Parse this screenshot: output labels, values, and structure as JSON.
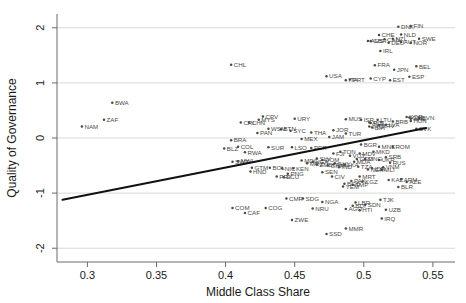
{
  "chart_data": {
    "type": "scatter",
    "title": "",
    "xlabel": "Middle Class Share",
    "ylabel": "Quality of Governance",
    "xlim": [
      0.278,
      0.566
    ],
    "ylim": [
      -2.25,
      2.25
    ],
    "xticks": [
      0.3,
      0.35,
      0.4,
      0.45,
      0.5,
      0.55
    ],
    "xticklabels": [
      "0.3",
      "0.35",
      "0.4",
      "0.45",
      "0.5",
      "0.55"
    ],
    "yticks": [
      -2,
      -1,
      0,
      1,
      2
    ],
    "yticklabels": [
      "-2",
      "-1",
      "0",
      "1",
      "2"
    ],
    "grid": "horizontal-gridlines-at-yticks",
    "legend": "none",
    "marker": "small filled circle with country ISO3 label to the right",
    "fit_line": {
      "label": "linear fit",
      "x_start": 0.282,
      "y_start": -1.12,
      "x_end": 0.545,
      "y_end": 0.18
    },
    "points": [
      {
        "label": "BWA",
        "x": 0.318,
        "y": 0.64
      },
      {
        "label": "ZAF",
        "x": 0.312,
        "y": 0.33
      },
      {
        "label": "NAM",
        "x": 0.296,
        "y": 0.21
      },
      {
        "label": "CHL",
        "x": 0.404,
        "y": 1.33
      },
      {
        "label": "CPV",
        "x": 0.427,
        "y": 0.39
      },
      {
        "label": "PAN",
        "x": 0.423,
        "y": 0.09
      },
      {
        "label": "SYC",
        "x": 0.447,
        "y": 0.13
      },
      {
        "label": "BRA",
        "x": 0.404,
        "y": -0.04
      },
      {
        "label": "COL",
        "x": 0.409,
        "y": -0.16
      },
      {
        "label": "BLZ",
        "x": 0.399,
        "y": -0.19
      },
      {
        "label": "SUR",
        "x": 0.431,
        "y": -0.17
      },
      {
        "label": "LSO",
        "x": 0.448,
        "y": -0.17
      },
      {
        "label": "PER",
        "x": 0.462,
        "y": -0.18
      },
      {
        "label": "MEX",
        "x": 0.455,
        "y": -0.02
      },
      {
        "label": "JAM",
        "x": 0.475,
        "y": 0.02
      },
      {
        "label": "RWA",
        "x": 0.414,
        "y": -0.26
      },
      {
        "label": "MWI",
        "x": 0.409,
        "y": -0.42
      },
      {
        "label": "SWZ",
        "x": 0.405,
        "y": -0.43
      },
      {
        "label": "GTM",
        "x": 0.419,
        "y": -0.54
      },
      {
        "label": "BOL",
        "x": 0.432,
        "y": -0.54
      },
      {
        "label": "NIC",
        "x": 0.441,
        "y": -0.55
      },
      {
        "label": "KEN",
        "x": 0.449,
        "y": -0.55
      },
      {
        "label": "HND",
        "x": 0.418,
        "y": -0.61
      },
      {
        "label": "PRY",
        "x": 0.437,
        "y": -0.7
      },
      {
        "label": "ECU",
        "x": 0.442,
        "y": -0.71
      },
      {
        "label": "COM",
        "x": 0.405,
        "y": -1.27
      },
      {
        "label": "COG",
        "x": 0.429,
        "y": -1.27
      },
      {
        "label": "CAF",
        "x": 0.414,
        "y": -1.36
      },
      {
        "label": "ZWE",
        "x": 0.448,
        "y": -1.49
      },
      {
        "label": "SSD",
        "x": 0.473,
        "y": -1.74
      },
      {
        "label": "MMR",
        "x": 0.487,
        "y": -1.64
      },
      {
        "label": "NRU",
        "x": 0.463,
        "y": -1.28
      },
      {
        "label": "NGA",
        "x": 0.47,
        "y": -1.16
      },
      {
        "label": "CMR",
        "x": 0.444,
        "y": -1.1
      },
      {
        "label": "SDG",
        "x": 0.456,
        "y": -1.1
      },
      {
        "label": "AGO",
        "x": 0.487,
        "y": -1.29
      },
      {
        "label": "BDI",
        "x": 0.492,
        "y": -1.23
      },
      {
        "label": "HTI",
        "x": 0.497,
        "y": -1.31
      },
      {
        "label": "UZB",
        "x": 0.516,
        "y": -1.3
      },
      {
        "label": "TJK",
        "x": 0.512,
        "y": -1.12
      },
      {
        "label": "LBR",
        "x": 0.494,
        "y": -1.17
      },
      {
        "label": "SDN",
        "x": 0.501,
        "y": -1.21
      },
      {
        "label": "IRQ",
        "x": 0.513,
        "y": -1.46
      },
      {
        "label": "BLR",
        "x": 0.525,
        "y": -0.89
      },
      {
        "label": "KAZ",
        "x": 0.518,
        "y": -0.76
      },
      {
        "label": "AZE",
        "x": 0.531,
        "y": -0.8
      },
      {
        "label": "ARM",
        "x": 0.527,
        "y": -0.75
      },
      {
        "label": "MRT",
        "x": 0.497,
        "y": -0.7
      },
      {
        "label": "PAK",
        "x": 0.491,
        "y": -0.78
      },
      {
        "label": "KGZ",
        "x": 0.499,
        "y": -0.79
      },
      {
        "label": "TMP",
        "x": 0.492,
        "y": -0.85
      },
      {
        "label": "YEM",
        "x": 0.485,
        "y": -0.88
      },
      {
        "label": "BGD",
        "x": 0.486,
        "y": -0.83
      },
      {
        "label": "URY",
        "x": 0.45,
        "y": 0.35
      },
      {
        "label": "MUS",
        "x": 0.487,
        "y": 0.34
      },
      {
        "label": "CHN",
        "x": 0.417,
        "y": 0.28
      },
      {
        "label": "MYS",
        "x": 0.424,
        "y": 0.33
      },
      {
        "label": "WSM",
        "x": 0.431,
        "y": 0.17
      },
      {
        "label": "BTN",
        "x": 0.44,
        "y": 0.16
      },
      {
        "label": "THA",
        "x": 0.462,
        "y": 0.1
      },
      {
        "label": "JOR",
        "x": 0.478,
        "y": 0.14
      },
      {
        "label": "TUR",
        "x": 0.487,
        "y": 0.08
      },
      {
        "label": "ALB",
        "x": 0.504,
        "y": 0.28
      },
      {
        "label": "LTU",
        "x": 0.51,
        "y": 0.33
      },
      {
        "label": "POL",
        "x": 0.505,
        "y": 0.27
      },
      {
        "label": "HRV",
        "x": 0.511,
        "y": 0.23
      },
      {
        "label": "LVA",
        "x": 0.516,
        "y": 0.24
      },
      {
        "label": "SVN",
        "x": 0.54,
        "y": 0.36
      },
      {
        "label": "CZE",
        "x": 0.533,
        "y": 0.37
      },
      {
        "label": "HUN",
        "x": 0.534,
        "y": 0.31
      },
      {
        "label": "SVK",
        "x": 0.538,
        "y": 0.17
      },
      {
        "label": "BGR",
        "x": 0.498,
        "y": -0.12
      },
      {
        "label": "MNE",
        "x": 0.511,
        "y": -0.16
      },
      {
        "label": "ROM",
        "x": 0.521,
        "y": -0.16
      },
      {
        "label": "MKD",
        "x": 0.507,
        "y": -0.25
      },
      {
        "label": "SRB",
        "x": 0.516,
        "y": -0.35
      },
      {
        "label": "MNG",
        "x": 0.501,
        "y": -0.38
      },
      {
        "label": "UKR",
        "x": 0.511,
        "y": -0.4
      },
      {
        "label": "RUS",
        "x": 0.519,
        "y": -0.45
      },
      {
        "label": "GEO",
        "x": 0.495,
        "y": -0.38
      },
      {
        "label": "MDA",
        "x": 0.493,
        "y": -0.43
      },
      {
        "label": "VNM",
        "x": 0.514,
        "y": -0.53
      },
      {
        "label": "IDN",
        "x": 0.506,
        "y": -0.55
      },
      {
        "label": "PHL",
        "x": 0.478,
        "y": -0.48
      },
      {
        "label": "IND",
        "x": 0.482,
        "y": -0.53
      },
      {
        "label": "LKA",
        "x": 0.486,
        "y": -0.48
      },
      {
        "label": "GHA",
        "x": 0.474,
        "y": -0.5
      },
      {
        "label": "SEN",
        "x": 0.47,
        "y": -0.62
      },
      {
        "label": "CIV",
        "x": 0.477,
        "y": -0.7
      },
      {
        "label": "TZA",
        "x": 0.496,
        "y": -0.52
      },
      {
        "label": "GUY",
        "x": 0.479,
        "y": -0.46
      },
      {
        "label": "ZMB",
        "x": 0.466,
        "y": -0.48
      },
      {
        "label": "NER",
        "x": 0.503,
        "y": -0.57
      },
      {
        "label": "MLI",
        "x": 0.513,
        "y": -0.58
      },
      {
        "label": "PNG",
        "x": 0.445,
        "y": -0.65
      },
      {
        "label": "MOZ",
        "x": 0.459,
        "y": -0.46
      },
      {
        "label": "UGA",
        "x": 0.463,
        "y": -0.43
      },
      {
        "label": "SLV",
        "x": 0.466,
        "y": -0.37
      },
      {
        "label": "DOM",
        "x": 0.47,
        "y": -0.4
      },
      {
        "label": "MDG",
        "x": 0.455,
        "y": -0.41
      },
      {
        "label": "VUT",
        "x": 0.49,
        "y": -0.32
      },
      {
        "label": "MDV",
        "x": 0.497,
        "y": -0.28
      },
      {
        "label": "TON",
        "x": 0.483,
        "y": -0.25
      },
      {
        "label": "FJI",
        "x": 0.478,
        "y": -0.28
      },
      {
        "label": "USA",
        "x": 0.473,
        "y": 1.12
      },
      {
        "label": "IRL",
        "x": 0.512,
        "y": 1.58
      },
      {
        "label": "CHE",
        "x": 0.511,
        "y": 1.87
      },
      {
        "label": "NLD",
        "x": 0.527,
        "y": 1.88
      },
      {
        "label": "SWE",
        "x": 0.54,
        "y": 1.8
      },
      {
        "label": "NOR",
        "x": 0.534,
        "y": 1.73
      },
      {
        "label": "DNK",
        "x": 0.525,
        "y": 2.02
      },
      {
        "label": "FIN",
        "x": 0.534,
        "y": 2.03
      },
      {
        "label": "AUS",
        "x": 0.503,
        "y": 1.76
      },
      {
        "label": "AUT",
        "x": 0.527,
        "y": 1.74
      },
      {
        "label": "DEU",
        "x": 0.518,
        "y": 1.73
      },
      {
        "label": "CAN",
        "x": 0.515,
        "y": 1.79
      },
      {
        "label": "GBR",
        "x": 0.505,
        "y": 1.76
      },
      {
        "label": "NZL",
        "x": 0.521,
        "y": 1.8
      },
      {
        "label": "FRA",
        "x": 0.508,
        "y": 1.32
      },
      {
        "label": "JPN",
        "x": 0.522,
        "y": 1.24
      },
      {
        "label": "BEL",
        "x": 0.538,
        "y": 1.3
      },
      {
        "label": "ESP",
        "x": 0.533,
        "y": 1.11
      },
      {
        "label": "CYP",
        "x": 0.505,
        "y": 1.08
      },
      {
        "label": "EST",
        "x": 0.519,
        "y": 1.05
      },
      {
        "label": "PRT",
        "x": 0.49,
        "y": 1.06
      },
      {
        "label": "ITA",
        "x": 0.487,
        "y": 1.05
      },
      {
        "label": "ISR",
        "x": 0.498,
        "y": 0.33
      },
      {
        "label": "KOR",
        "x": 0.531,
        "y": 0.38
      },
      {
        "label": "ARE",
        "x": 0.534,
        "y": 0.35
      },
      {
        "label": "BRB",
        "x": 0.521,
        "y": 0.3
      },
      {
        "label": "CRI",
        "x": 0.411,
        "y": 0.28
      },
      {
        "label": "TTO",
        "x": 0.504,
        "y": 0.21
      },
      {
        "label": "BIH",
        "x": 0.506,
        "y": 0.19
      }
    ]
  }
}
